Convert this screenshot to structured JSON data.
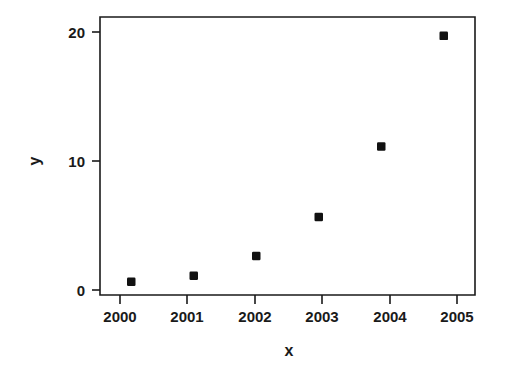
{
  "chart_data": {
    "type": "scatter",
    "title": "",
    "xlabel": "x",
    "ylabel": "y",
    "x": [
      2000,
      2001,
      2002,
      2003,
      2004,
      2005
    ],
    "values": [
      0.45,
      0.93,
      2.5,
      5.6,
      11.2,
      20.0
    ],
    "series": [
      {
        "name": "y",
        "values": [
          0.45,
          0.93,
          2.5,
          5.6,
          11.2,
          20.0
        ]
      }
    ],
    "xtick_labels": [
      "2000",
      "2001",
      "2002",
      "2003",
      "2004",
      "2005"
    ],
    "ytick_labels": [
      "0",
      "10",
      "20"
    ],
    "ytick_values": [
      0,
      10,
      20
    ],
    "xlim": [
      1999.5,
      2005.5
    ],
    "ylim": [
      -0.6,
      21.5
    ],
    "grid": false,
    "legend": false,
    "marker": "filled-square",
    "marker_color": "#111111",
    "frame": true,
    "background": "#ffffff"
  }
}
